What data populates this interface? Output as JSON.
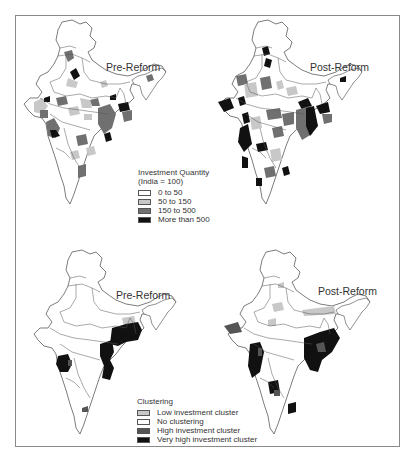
{
  "figure": {
    "top_panel": {
      "maps": [
        {
          "id": "pre",
          "title": "Pre-Reform"
        },
        {
          "id": "post",
          "title": "Post-Reform"
        }
      ],
      "legend": {
        "title_line1": "Investment Quantity",
        "title_line2": "(India = 100)",
        "items": [
          {
            "label": "0 to 50",
            "color": "#ffffff"
          },
          {
            "label": "50 to 150",
            "color": "#c8c8c8"
          },
          {
            "label": "150 to 500",
            "color": "#707070"
          },
          {
            "label": "More than 500",
            "color": "#111111"
          }
        ]
      }
    },
    "bottom_panel": {
      "maps": [
        {
          "id": "pre",
          "title": "Pre-Reform"
        },
        {
          "id": "post",
          "title": "Post-Reform"
        }
      ],
      "legend": {
        "title": "Clustering",
        "items": [
          {
            "label": "Low investment cluster",
            "color": "#c8c8c8"
          },
          {
            "label": "No clustering",
            "color": "#ffffff"
          },
          {
            "label": "High investment cluster",
            "color": "#555555"
          },
          {
            "label": "Very high investment cluster",
            "color": "#111111"
          }
        ]
      }
    }
  },
  "colors": {
    "border": "#8a8a8a",
    "outline": "#444444",
    "light": "#c8c8c8",
    "mid": "#707070",
    "dark": "#111111"
  }
}
